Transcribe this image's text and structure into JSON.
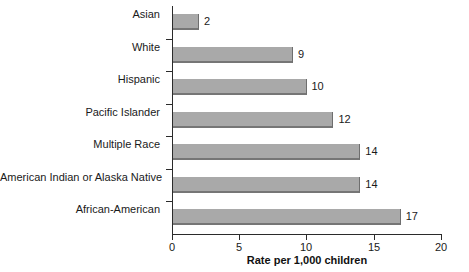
{
  "chart_data": {
    "type": "bar",
    "orientation": "horizontal",
    "title": "",
    "xlabel": "Rate per 1,000 children",
    "ylabel": "",
    "xlim": [
      0,
      20
    ],
    "xticks": [
      "0",
      "5",
      "10",
      "15",
      "20"
    ],
    "grid": false,
    "legend": false,
    "categories": [
      "Asian",
      "White",
      "Hispanic",
      "Pacific Islander",
      "Multiple Race",
      "American Indian or Alaska Native",
      "African-American"
    ],
    "values": [
      2,
      9,
      10,
      12,
      14,
      14,
      17
    ],
    "value_labels": [
      "2",
      "9",
      "10",
      "12",
      "14",
      "14",
      "17"
    ],
    "bar_color": "#a9a9a9",
    "bar_edge_color": "#6e6e6e",
    "axis_color": "#2b2b2b",
    "background_color": "#ffffff"
  }
}
